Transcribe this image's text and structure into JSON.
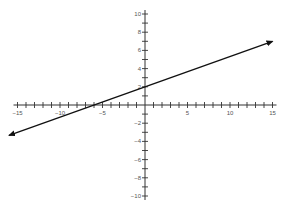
{
  "chart_data": {
    "type": "line",
    "title": "",
    "xlabel": "",
    "ylabel": "",
    "xlim": [
      -15,
      15
    ],
    "ylim": [
      -10,
      10
    ],
    "grid": false,
    "x_ticks_minor_step": 1,
    "y_ticks_minor_step": 1,
    "x_tick_labels": [
      -15,
      -10,
      -5,
      5,
      10,
      15
    ],
    "y_tick_labels": [
      10,
      8,
      6,
      4,
      2,
      -2,
      -4,
      -6,
      -8,
      -10
    ],
    "series": [
      {
        "name": "y = (1/3)x + 2",
        "equation": "y = x/3 + 2",
        "slope": 0.3333,
        "y_intercept": 2,
        "x_intercept": -6,
        "x": [
          -16,
          15
        ],
        "y": [
          -3.33,
          7
        ],
        "arrows_both_ends": true,
        "color": "#111111"
      }
    ]
  },
  "layout": {
    "origin_px": [
      145,
      105
    ],
    "px_per_unit_x": 8.5,
    "px_per_unit_y": 9.1,
    "axis_color": "#333333",
    "line_color": "#111111"
  }
}
